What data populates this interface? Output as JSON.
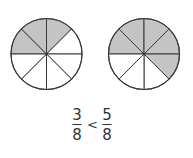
{
  "diagram": {
    "colors": {
      "shade": "#c4c4c4",
      "line": "#3a3a3a",
      "text": "#333333",
      "background": "#ffffff"
    },
    "circles": [
      {
        "name": "left-circle",
        "cx": 46.5,
        "cy": 54,
        "r": 35.5,
        "sectors": 8,
        "shaded": 3
      },
      {
        "name": "right-circle",
        "cx": 144,
        "cy": 54,
        "r": 35.5,
        "sectors": 8,
        "shaded": 5
      }
    ],
    "comparison": {
      "left": {
        "numerator": "3",
        "denominator": "8"
      },
      "operator": "<",
      "right": {
        "numerator": "5",
        "denominator": "8"
      }
    }
  }
}
